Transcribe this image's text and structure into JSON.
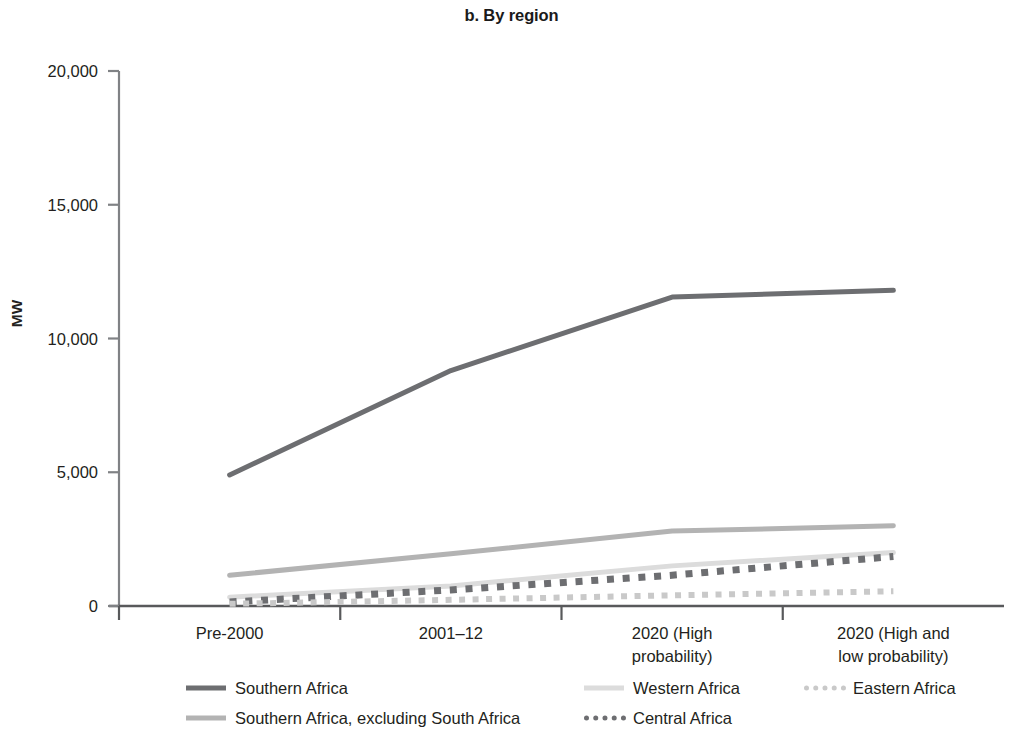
{
  "chart_data": {
    "type": "line",
    "title": "b. By region",
    "xlabel": "",
    "ylabel": "MW",
    "ylim": [
      0,
      20000
    ],
    "yticks": [
      0,
      5000,
      10000,
      15000,
      20000
    ],
    "ytick_labels": [
      "0",
      "5,000",
      "10,000",
      "15,000",
      "20,000"
    ],
    "grid": false,
    "legend_position": "bottom",
    "categories": [
      "Pre-2000",
      "2001–12",
      "2020 (High probability)",
      "2020 (High and low probability)"
    ],
    "category_lines": [
      [
        "Pre-2000"
      ],
      [
        "2001–12"
      ],
      [
        "2020 (High",
        "probability)"
      ],
      [
        "2020 (High and",
        "low probability)"
      ]
    ],
    "series": [
      {
        "name": "Southern Africa",
        "values": [
          4900,
          8800,
          11550,
          11800
        ],
        "color": "#6d6e71",
        "style": "solid",
        "width": 5
      },
      {
        "name": "Southern Africa, excluding South Africa",
        "values": [
          1150,
          1950,
          2800,
          3000
        ],
        "color": "#b3b3b3",
        "style": "solid",
        "width": 5
      },
      {
        "name": "Western Africa",
        "values": [
          330,
          750,
          1500,
          2000
        ],
        "color": "#dcdcdc",
        "style": "solid",
        "width": 5
      },
      {
        "name": "Central Africa",
        "values": [
          150,
          600,
          1150,
          1850
        ],
        "color": "#6d6e71",
        "style": "dotted",
        "width": 7
      },
      {
        "name": "Eastern Africa",
        "values": [
          80,
          230,
          400,
          550
        ],
        "color": "#c9c9c9",
        "style": "dotted",
        "width": 6
      }
    ]
  },
  "legend": {
    "row1": [
      {
        "label": "Southern Africa",
        "color": "#6d6e71",
        "style": "solid"
      },
      {
        "label": "Western Africa",
        "color": "#dcdcdc",
        "style": "solid"
      },
      {
        "label": "Eastern Africa",
        "color": "#c9c9c9",
        "style": "dotted"
      }
    ],
    "row2": [
      {
        "label": "Southern Africa, excluding South Africa",
        "color": "#b3b3b3",
        "style": "solid"
      },
      {
        "label": "Central Africa",
        "color": "#6d6e71",
        "style": "dotted"
      }
    ]
  },
  "axis": {
    "y_title": "MW"
  }
}
